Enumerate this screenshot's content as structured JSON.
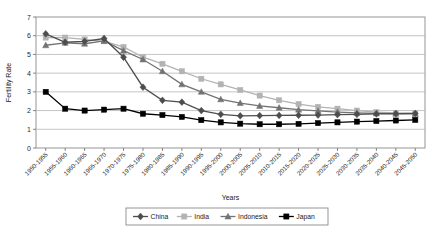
{
  "chart_data": {
    "type": "line",
    "title": "",
    "xlabel": "Years",
    "ylabel": "Fertility Rate",
    "ylim": [
      0,
      7
    ],
    "ytick_step": 1,
    "grid": true,
    "legend_position": "bottom",
    "yticks": [
      "0",
      "1",
      "2",
      "3",
      "4",
      "5",
      "6",
      "7"
    ],
    "categories": [
      "1950-1955",
      "1955-1960",
      "1960-1965",
      "1965-1970",
      "1970-1975",
      "1975-1980",
      "1980-1985",
      "1985-1990",
      "1990-1995",
      "1995-2000",
      "2000-2005",
      "2005-2010",
      "2010-2015",
      "2015-2020",
      "2020-2025",
      "2025-2030",
      "2030-2035",
      "2035-2040",
      "2040-2045",
      "2045-2050"
    ],
    "series": [
      {
        "name": "China",
        "color": "#4d4d4d",
        "marker": "diamond",
        "values": [
          6.1,
          5.65,
          5.7,
          5.85,
          4.85,
          3.25,
          2.55,
          2.45,
          2.0,
          1.8,
          1.72,
          1.73,
          1.74,
          1.75,
          1.76,
          1.78,
          1.8,
          1.82,
          1.84,
          1.85
        ]
      },
      {
        "name": "India",
        "color": "#b3b3b3",
        "marker": "square",
        "values": [
          5.9,
          5.9,
          5.8,
          5.7,
          5.4,
          4.85,
          4.5,
          4.1,
          3.7,
          3.4,
          3.1,
          2.8,
          2.55,
          2.35,
          2.2,
          2.1,
          2.0,
          1.92,
          1.87,
          1.85
        ]
      },
      {
        "name": "Indonesia",
        "color": "#737373",
        "marker": "triangle",
        "values": [
          5.49,
          5.62,
          5.57,
          5.72,
          5.2,
          4.73,
          4.1,
          3.4,
          3.0,
          2.6,
          2.4,
          2.25,
          2.15,
          2.05,
          1.98,
          1.92,
          1.88,
          1.85,
          1.83,
          1.82
        ]
      },
      {
        "name": "Japan",
        "color": "#000000",
        "marker": "square",
        "values": [
          3.0,
          2.1,
          2.0,
          2.05,
          2.1,
          1.83,
          1.76,
          1.66,
          1.49,
          1.37,
          1.3,
          1.27,
          1.27,
          1.29,
          1.33,
          1.37,
          1.41,
          1.44,
          1.47,
          1.5
        ]
      }
    ]
  },
  "legend": {
    "items": [
      {
        "label": "China"
      },
      {
        "label": "India"
      },
      {
        "label": "Indonesia"
      },
      {
        "label": "Japan"
      }
    ]
  }
}
